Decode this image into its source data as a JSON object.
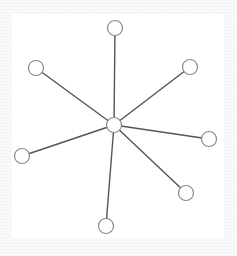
{
  "diagram": {
    "type": "star-graph",
    "colors": {
      "background": "#ffffff",
      "edge": "#555555",
      "node_fill": "#ffffff",
      "node_stroke": "#8a8a8a"
    },
    "node_radius": 7.5,
    "center": {
      "id": "center",
      "x": 114,
      "y": 125
    },
    "leaves": [
      {
        "id": "top",
        "x": 115,
        "y": 28
      },
      {
        "id": "top-right",
        "x": 190,
        "y": 67
      },
      {
        "id": "right",
        "x": 209,
        "y": 139
      },
      {
        "id": "bottom-right",
        "x": 186,
        "y": 193
      },
      {
        "id": "bottom",
        "x": 106,
        "y": 226
      },
      {
        "id": "left",
        "x": 22,
        "y": 156
      },
      {
        "id": "top-left",
        "x": 36,
        "y": 68
      }
    ]
  }
}
